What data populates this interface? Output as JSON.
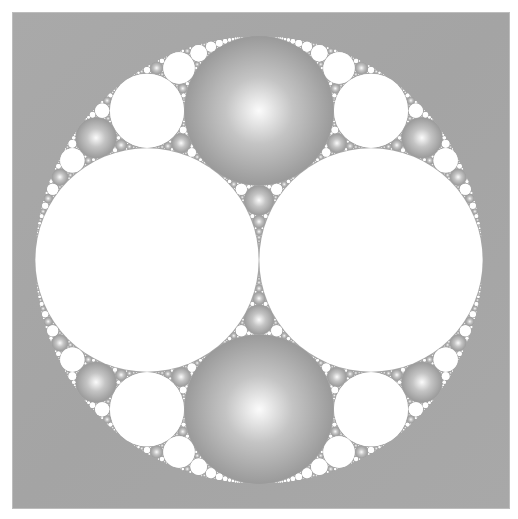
{
  "figure": {
    "type": "apollonian-gasket",
    "canvas": {
      "width": 518,
      "height": 519
    },
    "frame": {
      "x": 13,
      "y": 13,
      "width": 496,
      "height": 495,
      "color": "#a7a7a7"
    },
    "outer_circle": {
      "cx": 259,
      "cy": 260,
      "r": 224
    },
    "initial_circles": [
      {
        "name": "left-white",
        "cx_offset": -0.5,
        "cy_offset": 0,
        "r_frac": 0.5,
        "color": "white"
      },
      {
        "name": "right-white",
        "cx_offset": 0.5,
        "cy_offset": 0,
        "r_frac": 0.5,
        "color": "white"
      },
      {
        "name": "top-gray",
        "color": "gray"
      },
      {
        "name": "bottom-gray",
        "color": "gray"
      }
    ],
    "colors": {
      "white": "#ffffff",
      "gray_edge": "#9a9a9a",
      "gray_mid": "#c4c4c4",
      "gray_highlight": "#fbfbfb",
      "outer_fill": "#a7a7a7"
    },
    "coloring_rule": "new circle takes color of its Descartes sibling",
    "min_radius_px": 0.6
  }
}
